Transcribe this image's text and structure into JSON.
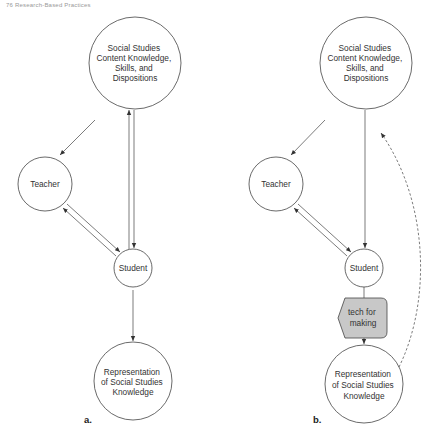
{
  "header": {
    "text": "76    Research-Based Practices"
  },
  "diagrams": [
    {
      "caption": "a.",
      "nodes": {
        "content": [
          "Social Studies",
          "Content Knowledge,",
          "Skills, and",
          "Dispositions"
        ],
        "teacher": "Teacher",
        "student": "Student",
        "representation": [
          "Representation",
          "of Social Studies",
          "Knowledge"
        ]
      }
    },
    {
      "caption": "b.",
      "nodes": {
        "content": [
          "Social Studies",
          "Content Knowledge,",
          "Skills, and",
          "Dispositions"
        ],
        "teacher": "Teacher",
        "student": "Student",
        "tech": [
          "tech for",
          "making"
        ],
        "representation": [
          "Representation",
          "of Social Studies",
          "Knowledge"
        ]
      }
    }
  ],
  "colors": {
    "stroke": "#444444",
    "tech_fill": "#c8c8c8",
    "text": "#333333"
  }
}
